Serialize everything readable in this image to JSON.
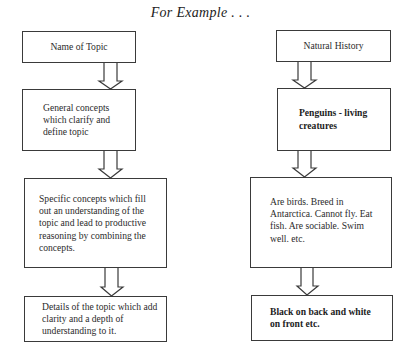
{
  "title": "For Example . . .",
  "left_column": {
    "boxes": [
      {
        "text": "Name of Topic"
      },
      {
        "text": "General concepts which clarify and define topic"
      },
      {
        "text": "Specific concepts which fill out an understanding of the topic and lead to productive reasoning by combining the concepts."
      },
      {
        "text": "Details of the topic which add clarity and a depth of understanding to it."
      }
    ]
  },
  "right_column": {
    "boxes": [
      {
        "text": "Natural History"
      },
      {
        "text": "Penguins - living creatures"
      },
      {
        "text": "Are birds. Breed in Antarctica. Cannot fly. Eat fish. Are sociable. Swim well. etc."
      },
      {
        "text": "Black on back and white on front etc."
      }
    ]
  }
}
